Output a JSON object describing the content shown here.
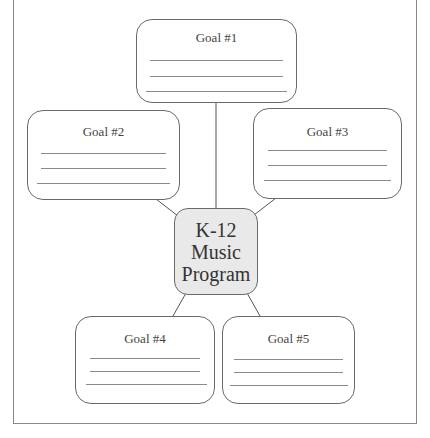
{
  "diagram": {
    "type": "concept-map",
    "center": {
      "lines": [
        "K-12",
        "Music",
        "Program"
      ],
      "fill": "#e9e9e9"
    },
    "goals": [
      {
        "label": "Goal #1",
        "blank_lines": 3
      },
      {
        "label": "Goal #2",
        "blank_lines": 3
      },
      {
        "label": "Goal #3",
        "blank_lines": 3
      },
      {
        "label": "Goal #4",
        "blank_lines": 3
      },
      {
        "label": "Goal #5",
        "blank_lines": 3
      }
    ],
    "colors": {
      "border": "#6a6a6a",
      "line": "#8a8a8a",
      "text": "#444444"
    }
  }
}
